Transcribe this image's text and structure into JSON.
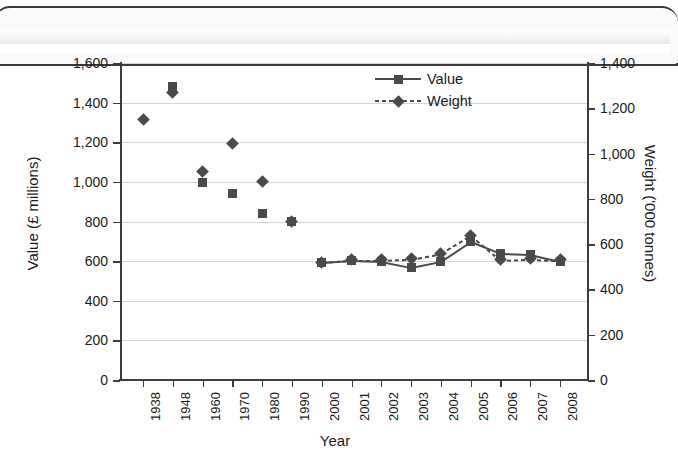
{
  "chart_data": {
    "type": "scatter",
    "title": "",
    "xlabel": "Year",
    "ylabel": "Value (£ millions)",
    "y2label": "Weight ('000 tonnes)",
    "ylim": [
      0,
      1600
    ],
    "y2lim": [
      0,
      1400
    ],
    "grid": true,
    "legend_position": "top-center-right",
    "categories": [
      "1938",
      "1948",
      "1960",
      "1970",
      "1980",
      "1990",
      "2000",
      "2001",
      "2002",
      "2003",
      "2004",
      "2005",
      "2006",
      "2007",
      "2008"
    ],
    "y_ticks": [
      "0",
      "200",
      "400",
      "600",
      "800",
      "1,000",
      "1,200",
      "1,400",
      "1,600"
    ],
    "y2_ticks": [
      "0",
      "200",
      "400",
      "600",
      "800",
      "1,000",
      "1,200",
      "1,400"
    ],
    "series": [
      {
        "name": "Value",
        "axis": "left",
        "marker": "square",
        "line": "solid",
        "color": "#4a4a4a",
        "values": [
          null,
          1480,
          995,
          940,
          840,
          800,
          595,
          605,
          600,
          570,
          600,
          700,
          640,
          635,
          600
        ],
        "connected_from": "2000"
      },
      {
        "name": "Weight",
        "axis": "right",
        "marker": "diamond",
        "line": "dashed",
        "color": "#4a4a4a",
        "values": [
          1150,
          1270,
          920,
          1045,
          875,
          700,
          520,
          530,
          530,
          535,
          560,
          640,
          530,
          535,
          530
        ],
        "connected_from": "2000"
      }
    ]
  },
  "legend": {
    "items": [
      {
        "label": "Value",
        "marker": "square",
        "line": "solid"
      },
      {
        "label": "Weight",
        "marker": "diamond",
        "line": "dashed"
      }
    ]
  },
  "colors": {
    "marker": "#4a4a4a",
    "grid": "#d4d4d4",
    "axis": "#3c3c3c",
    "text": "#1a1a1a",
    "background": "#ffffff"
  }
}
